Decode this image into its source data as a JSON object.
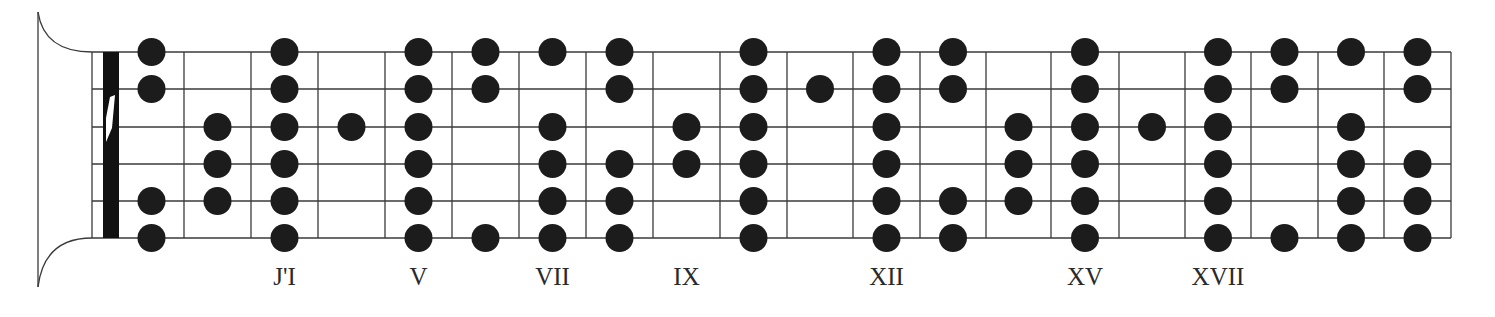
{
  "diagram": {
    "type": "guitar-fretboard-scale-map",
    "strings": 6,
    "frets": 20,
    "colors": {
      "background": "#ffffff",
      "line": "#3a3a3a",
      "dot": "#1c1c1c",
      "nut": "#111111",
      "label": "#2a2a2a"
    },
    "geometry": {
      "headstock_x": 38,
      "headstock_top": 12,
      "headstock_bottom": 287,
      "board_left": 92,
      "nut_left": 103,
      "nut_right": 119,
      "board_right": 1451,
      "string_y": [
        52,
        89,
        127,
        164,
        201,
        238
      ],
      "fret_x": [
        119,
        184,
        251,
        318,
        385,
        452,
        519,
        586,
        653,
        720,
        787,
        853,
        920,
        986,
        1051,
        1119,
        1185,
        1251,
        1318,
        1384,
        1451
      ],
      "dot_radius": 14
    },
    "dots": [
      {
        "fret": 1,
        "strings": [
          1,
          2,
          5,
          6
        ]
      },
      {
        "fret": 2,
        "strings": [
          3,
          4,
          5
        ]
      },
      {
        "fret": 3,
        "strings": [
          1,
          2,
          3,
          4,
          5,
          6
        ]
      },
      {
        "fret": 4,
        "strings": [
          3
        ]
      },
      {
        "fret": 5,
        "strings": [
          1,
          2,
          3,
          4,
          5,
          6
        ]
      },
      {
        "fret": 6,
        "strings": [
          1,
          2,
          6
        ]
      },
      {
        "fret": 7,
        "strings": [
          1,
          3,
          4,
          5,
          6
        ]
      },
      {
        "fret": 8,
        "strings": [
          1,
          2,
          4,
          5,
          6
        ]
      },
      {
        "fret": 9,
        "strings": [
          3,
          4
        ]
      },
      {
        "fret": 10,
        "strings": [
          1,
          2,
          3,
          4,
          5,
          6
        ]
      },
      {
        "fret": 11,
        "strings": [
          2
        ]
      },
      {
        "fret": 12,
        "strings": [
          1,
          2,
          3,
          4,
          5,
          6
        ]
      },
      {
        "fret": 13,
        "strings": [
          1,
          2,
          5,
          6
        ]
      },
      {
        "fret": 14,
        "strings": [
          3,
          4,
          5
        ]
      },
      {
        "fret": 15,
        "strings": [
          1,
          2,
          3,
          4,
          5,
          6
        ]
      },
      {
        "fret": 16,
        "strings": [
          3
        ]
      },
      {
        "fret": 17,
        "strings": [
          1,
          2,
          3,
          4,
          5,
          6
        ]
      },
      {
        "fret": 18,
        "strings": [
          1,
          2,
          6
        ]
      },
      {
        "fret": 19,
        "strings": [
          1,
          3,
          4,
          5,
          6
        ]
      },
      {
        "fret": 20,
        "strings": [
          1,
          2,
          4,
          5,
          6
        ]
      }
    ],
    "labels": [
      {
        "fret": 3,
        "text": "J'I"
      },
      {
        "fret": 5,
        "text": "V"
      },
      {
        "fret": 7,
        "text": "VII"
      },
      {
        "fret": 9,
        "text": "IX"
      },
      {
        "fret": 12,
        "text": "XII"
      },
      {
        "fret": 15,
        "text": "XV"
      },
      {
        "fret": 17,
        "text": "XVII"
      }
    ]
  }
}
